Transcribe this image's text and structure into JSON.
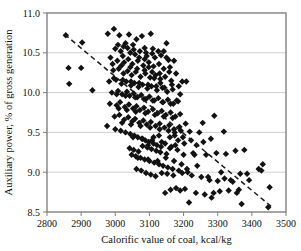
{
  "chart_data": {
    "type": "scatter",
    "title": "",
    "xlabel": "Calorific value of coal, kcal/kg",
    "ylabel": "Auxiliary power, % of gross generation",
    "xlim": [
      2800,
      3500
    ],
    "ylim": [
      8.5,
      11.0
    ],
    "xticks": [
      2800,
      2900,
      3000,
      3100,
      3200,
      3300,
      3400,
      3500
    ],
    "yticks": [
      8.5,
      9.0,
      9.5,
      10.0,
      10.5,
      11.0
    ],
    "xtick_labels": [
      "2800",
      "2900",
      "3000",
      "3100",
      "3200",
      "3300",
      "3400",
      "3500"
    ],
    "ytick_labels": [
      "8.5",
      "9.0",
      "9.5",
      "10.0",
      "10.5",
      "11.0"
    ],
    "grid": "horizontal",
    "legend": "none",
    "marker": "diamond",
    "marker_color": "#121212",
    "marker_size": 3.2,
    "series": [
      {
        "name": "Auxiliary power vs calorific value",
        "points": [
          [
            2855,
            10.72
          ],
          [
            2903,
            10.63
          ],
          [
            2863,
            10.31
          ],
          [
            2900,
            10.31
          ],
          [
            2865,
            10.11
          ],
          [
            2933,
            10.03
          ],
          [
            2978,
            10.74
          ],
          [
            2996,
            10.8
          ],
          [
            3012,
            10.72
          ],
          [
            3040,
            10.73
          ],
          [
            3062,
            10.67
          ],
          [
            3078,
            10.71
          ],
          [
            3104,
            10.74
          ],
          [
            3030,
            10.62
          ],
          [
            3052,
            10.6
          ],
          [
            3086,
            10.56
          ],
          [
            3108,
            10.49
          ],
          [
            3150,
            10.62
          ],
          [
            3000,
            10.55
          ],
          [
            3016,
            10.52
          ],
          [
            3022,
            10.46
          ],
          [
            3044,
            10.5
          ],
          [
            3058,
            10.48
          ],
          [
            3070,
            10.44
          ],
          [
            3092,
            10.46
          ],
          [
            3116,
            10.44
          ],
          [
            3134,
            10.47
          ],
          [
            3156,
            10.41
          ],
          [
            2986,
            10.44
          ],
          [
            3006,
            10.4
          ],
          [
            3026,
            10.38
          ],
          [
            3038,
            10.42
          ],
          [
            3050,
            10.36
          ],
          [
            3066,
            10.4
          ],
          [
            3082,
            10.34
          ],
          [
            3098,
            10.38
          ],
          [
            3112,
            10.33
          ],
          [
            3128,
            10.36
          ],
          [
            3142,
            10.3
          ],
          [
            3160,
            10.32
          ],
          [
            2994,
            10.28
          ],
          [
            3010,
            10.3
          ],
          [
            3024,
            10.24
          ],
          [
            3036,
            10.27
          ],
          [
            3048,
            10.22
          ],
          [
            3060,
            10.26
          ],
          [
            3074,
            10.2
          ],
          [
            3088,
            10.24
          ],
          [
            3102,
            10.19
          ],
          [
            3118,
            10.22
          ],
          [
            3132,
            10.17
          ],
          [
            3146,
            10.2
          ],
          [
            3164,
            10.15
          ],
          [
            3196,
            10.14
          ],
          [
            2982,
            10.14
          ],
          [
            3002,
            10.16
          ],
          [
            3018,
            10.11
          ],
          [
            3032,
            10.14
          ],
          [
            3046,
            10.09
          ],
          [
            3056,
            10.12
          ],
          [
            3068,
            10.07
          ],
          [
            3080,
            10.1
          ],
          [
            3094,
            10.05
          ],
          [
            3106,
            10.08
          ],
          [
            3122,
            10.03
          ],
          [
            3138,
            10.06
          ],
          [
            3152,
            10.01
          ],
          [
            3168,
            10.04
          ],
          [
            2990,
            10.0
          ],
          [
            3008,
            10.02
          ],
          [
            3020,
            9.98
          ],
          [
            3034,
            10.01
          ],
          [
            3042,
            9.96
          ],
          [
            3054,
            9.99
          ],
          [
            3064,
            9.94
          ],
          [
            3076,
            9.97
          ],
          [
            3090,
            9.92
          ],
          [
            3100,
            9.95
          ],
          [
            3114,
            9.9
          ],
          [
            3126,
            9.93
          ],
          [
            3140,
            9.88
          ],
          [
            3154,
            9.91
          ],
          [
            3170,
            9.86
          ],
          [
            3184,
            9.89
          ],
          [
            2984,
            9.86
          ],
          [
            3004,
            9.84
          ],
          [
            3014,
            9.88
          ],
          [
            3028,
            9.82
          ],
          [
            3040,
            9.85
          ],
          [
            3052,
            9.8
          ],
          [
            3062,
            9.83
          ],
          [
            3072,
            9.78
          ],
          [
            3084,
            9.81
          ],
          [
            3096,
            9.76
          ],
          [
            3110,
            9.79
          ],
          [
            3124,
            9.74
          ],
          [
            3136,
            9.77
          ],
          [
            3148,
            9.72
          ],
          [
            3162,
            9.75
          ],
          [
            3176,
            9.7
          ],
          [
            3190,
            9.73
          ],
          [
            2998,
            9.7
          ],
          [
            3012,
            9.72
          ],
          [
            3026,
            9.66
          ],
          [
            3038,
            9.69
          ],
          [
            3050,
            9.64
          ],
          [
            3058,
            9.67
          ],
          [
            3070,
            9.62
          ],
          [
            3082,
            9.65
          ],
          [
            3092,
            9.6
          ],
          [
            3104,
            9.63
          ],
          [
            3118,
            9.58
          ],
          [
            3130,
            9.61
          ],
          [
            3144,
            9.56
          ],
          [
            3158,
            9.59
          ],
          [
            3172,
            9.54
          ],
          [
            3188,
            9.57
          ],
          [
            3206,
            9.61
          ],
          [
            2976,
            9.58
          ],
          [
            3000,
            9.54
          ],
          [
            3016,
            9.52
          ],
          [
            3030,
            9.5
          ],
          [
            3044,
            9.48
          ],
          [
            3056,
            9.46
          ],
          [
            3066,
            9.44
          ],
          [
            3078,
            9.42
          ],
          [
            3088,
            9.4
          ],
          [
            3098,
            9.38
          ],
          [
            3112,
            9.36
          ],
          [
            3122,
            9.34
          ],
          [
            3134,
            9.32
          ],
          [
            3146,
            9.36
          ],
          [
            3160,
            9.3
          ],
          [
            3174,
            9.5
          ],
          [
            3192,
            9.52
          ],
          [
            3218,
            9.51
          ],
          [
            3246,
            9.5
          ],
          [
            3280,
            9.42
          ],
          [
            3042,
            9.3
          ],
          [
            3054,
            9.28
          ],
          [
            3068,
            9.26
          ],
          [
            3080,
            9.33
          ],
          [
            3094,
            9.31
          ],
          [
            3106,
            9.29
          ],
          [
            3120,
            9.27
          ],
          [
            3132,
            9.25
          ],
          [
            3150,
            9.23
          ],
          [
            3164,
            9.32
          ],
          [
            3182,
            9.28
          ],
          [
            3200,
            9.22
          ],
          [
            3228,
            9.24
          ],
          [
            3258,
            9.38
          ],
          [
            3290,
            9.71
          ],
          [
            3318,
            9.51
          ],
          [
            3048,
            9.22
          ],
          [
            3060,
            9.2
          ],
          [
            3074,
            9.18
          ],
          [
            3086,
            9.16
          ],
          [
            3100,
            9.14
          ],
          [
            3114,
            9.12
          ],
          [
            3128,
            9.1
          ],
          [
            3140,
            9.08
          ],
          [
            3154,
            9.06
          ],
          [
            3168,
            9.04
          ],
          [
            3186,
            9.02
          ],
          [
            3210,
            9.04
          ],
          [
            3240,
            9.08
          ],
          [
            3266,
            9.22
          ],
          [
            3296,
            9.24
          ],
          [
            3324,
            9.23
          ],
          [
            3352,
            9.27
          ],
          [
            3378,
            9.28
          ],
          [
            3420,
            9.04
          ],
          [
            3432,
            9.1
          ],
          [
            3062,
            9.04
          ],
          [
            3076,
            9.02
          ],
          [
            3090,
            8.99
          ],
          [
            3104,
            8.97
          ],
          [
            3118,
            8.95
          ],
          [
            3136,
            8.99
          ],
          [
            3152,
            8.98
          ],
          [
            3170,
            8.96
          ],
          [
            3196,
            8.99
          ],
          [
            3224,
            8.96
          ],
          [
            3252,
            8.94
          ],
          [
            3276,
            8.9
          ],
          [
            3300,
            8.89
          ],
          [
            3320,
            8.92
          ],
          [
            3344,
            8.88
          ],
          [
            3366,
            8.98
          ],
          [
            3392,
            8.9
          ],
          [
            3428,
            9.02
          ],
          [
            3452,
            8.81
          ],
          [
            3146,
            8.74
          ],
          [
            3162,
            8.78
          ],
          [
            3178,
            8.8
          ],
          [
            3190,
            8.77
          ],
          [
            3204,
            8.79
          ],
          [
            3216,
            8.62
          ],
          [
            3236,
            8.74
          ],
          [
            3262,
            8.72
          ],
          [
            3282,
            8.68
          ],
          [
            3306,
            8.76
          ],
          [
            3332,
            8.77
          ],
          [
            3356,
            8.74
          ],
          [
            3370,
            8.6
          ],
          [
            3448,
            8.56
          ],
          [
            3008,
            10.6
          ],
          [
            3024,
            10.58
          ],
          [
            3036,
            10.56
          ],
          [
            3054,
            10.54
          ],
          [
            3072,
            10.52
          ],
          [
            3090,
            10.5
          ],
          [
            3110,
            10.55
          ],
          [
            3126,
            10.52
          ],
          [
            3142,
            10.52
          ],
          [
            2992,
            10.36
          ],
          [
            3018,
            10.34
          ],
          [
            3044,
            10.32
          ],
          [
            3064,
            10.3
          ],
          [
            3086,
            10.28
          ],
          [
            3108,
            10.26
          ],
          [
            3130,
            10.24
          ],
          [
            3158,
            10.26
          ],
          [
            3178,
            10.24
          ],
          [
            2996,
            10.18
          ],
          [
            3022,
            10.16
          ],
          [
            3046,
            10.14
          ],
          [
            3070,
            10.12
          ],
          [
            3096,
            10.1
          ],
          [
            3120,
            10.08
          ],
          [
            3144,
            10.06
          ],
          [
            3166,
            10.1
          ],
          [
            3186,
            10.08
          ],
          [
            3004,
            9.98
          ],
          [
            3030,
            9.96
          ],
          [
            3058,
            9.94
          ],
          [
            3084,
            9.92
          ],
          [
            3110,
            9.9
          ],
          [
            3138,
            9.88
          ],
          [
            3162,
            9.86
          ],
          [
            3180,
            9.9
          ],
          [
            3010,
            9.8
          ],
          [
            3034,
            9.78
          ],
          [
            3060,
            9.76
          ],
          [
            3088,
            9.74
          ],
          [
            3116,
            9.72
          ],
          [
            3142,
            9.7
          ],
          [
            3168,
            9.68
          ],
          [
            3020,
            9.62
          ],
          [
            3046,
            9.6
          ],
          [
            3074,
            9.58
          ],
          [
            3102,
            9.56
          ],
          [
            3130,
            9.54
          ],
          [
            3156,
            9.52
          ],
          [
            3174,
            9.46
          ],
          [
            3052,
            9.44
          ],
          [
            3080,
            9.42
          ],
          [
            3108,
            9.4
          ],
          [
            3136,
            9.38
          ],
          [
            3160,
            9.44
          ],
          [
            3184,
            9.4
          ],
          [
            3202,
            9.36
          ],
          [
            3066,
            9.18
          ],
          [
            3096,
            9.16
          ],
          [
            3124,
            9.14
          ],
          [
            3148,
            9.18
          ],
          [
            3172,
            9.14
          ],
          [
            3194,
            9.1
          ],
          [
            3212,
            9.0
          ],
          [
            3096,
            9.34
          ],
          [
            3112,
            9.44
          ],
          [
            3128,
            9.46
          ],
          [
            3176,
            9.34
          ],
          [
            3198,
            9.44
          ],
          [
            3222,
            9.4
          ],
          [
            3238,
            9.34
          ],
          [
            3086,
            10.42
          ],
          [
            3098,
            10.32
          ],
          [
            3114,
            10.18
          ],
          [
            3132,
            10.12
          ],
          [
            3150,
            10.44
          ],
          [
            3172,
            10.4
          ],
          [
            3190,
            9.98
          ],
          [
            3208,
            10.14
          ],
          [
            3232,
            9.22
          ],
          [
            3256,
            9.62
          ],
          [
            3272,
            8.94
          ],
          [
            3288,
            8.74
          ],
          [
            3310,
            9.0
          ],
          [
            3338,
            8.9
          ],
          [
            3362,
            8.78
          ],
          [
            3386,
            8.98
          ]
        ]
      }
    ],
    "trendline": {
      "style": "dashed",
      "color": "#1a1a1a",
      "x_start": 2852,
      "y_start": 10.73,
      "x_end": 3462,
      "y_end": 8.55
    }
  }
}
